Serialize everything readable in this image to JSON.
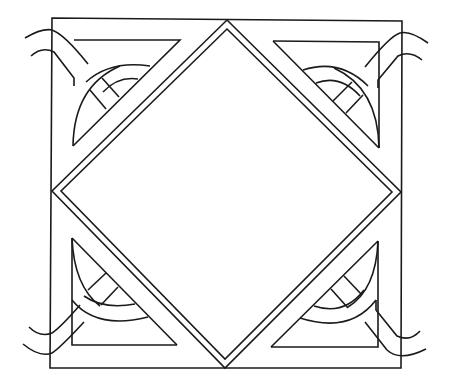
{
  "image": {
    "subject": "celtic-knot-square-diamond-pattern",
    "background_color": "#ffffff",
    "line_color": "#1a1a1a"
  }
}
